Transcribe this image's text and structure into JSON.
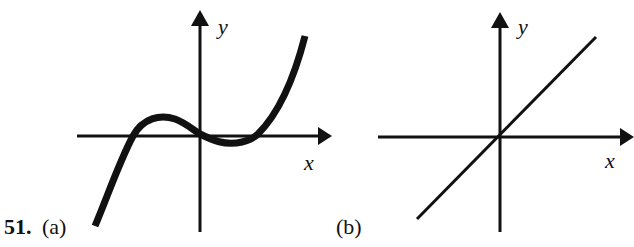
{
  "problem": {
    "number": "51.",
    "parts": [
      {
        "label": "(a)",
        "x_axis_label": "x",
        "y_axis_label": "y",
        "description": "Cubic-like curve: rises from lower left, crosses x-axis on the negative side, local max above axis, passes through origin, local min just below axis, touches axis on positive side, then rises steeply to upper right"
      },
      {
        "label": "(b)",
        "x_axis_label": "x",
        "y_axis_label": "y",
        "description": "Straight line through the origin with positive slope"
      }
    ]
  },
  "colors": {
    "ink": "#111111",
    "background": "#ffffff"
  }
}
